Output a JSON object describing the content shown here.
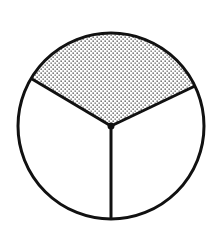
{
  "diagram": {
    "type": "fraction-circle",
    "total_parts": 3,
    "shaded_parts": 1,
    "fraction": "1/3",
    "shaded_part_position": "top",
    "fill_pattern": "dotted",
    "colors": {
      "stroke": "#111111",
      "background": "#ffffff",
      "dots": "#333333"
    }
  }
}
